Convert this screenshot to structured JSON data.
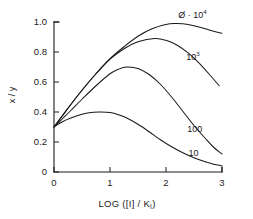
{
  "chart_data": {
    "type": "line",
    "title": "",
    "xlabel": "LOG ([I] / K",
    "xlabel_sub": "I",
    "xlabel_tail": ")",
    "ylabel": "x / y",
    "xlim": [
      0,
      3
    ],
    "ylim": [
      0,
      1.0
    ],
    "grid": false,
    "legend_position": "inline-curve-end",
    "xticks": [
      "0",
      "1",
      "2",
      "3"
    ],
    "xtick_values": [
      0,
      1,
      2,
      3
    ],
    "yticks": [
      "0",
      "0.2",
      "0.4",
      "0.6",
      "0.8",
      "1.0"
    ],
    "ytick_values": [
      0,
      0.2,
      0.4,
      0.6,
      0.8,
      1.0
    ],
    "common_origin": [
      0,
      0.3
    ],
    "series": [
      {
        "name": "phi-10-4",
        "label_base": "Ø · 10",
        "label_sup": "4",
        "label_x": 2.22,
        "label_y": 1.05,
        "peak_x": 2.15,
        "peak_y": 0.99,
        "end_y": 0.93,
        "x": [
          0,
          0.15,
          0.3,
          0.5,
          0.75,
          1.0,
          1.25,
          1.5,
          1.75,
          2.0,
          2.15,
          2.3,
          2.5,
          2.7,
          2.85,
          3.0
        ],
        "y": [
          0.3,
          0.375,
          0.45,
          0.545,
          0.655,
          0.755,
          0.835,
          0.905,
          0.955,
          0.983,
          0.99,
          0.988,
          0.975,
          0.955,
          0.938,
          0.925
        ]
      },
      {
        "name": "10-3",
        "label_base": "10",
        "label_sup": "3",
        "label_x": 2.36,
        "label_y": 0.77,
        "peak_x": 1.8,
        "peak_y": 0.89,
        "end_y": 0.56,
        "x": [
          0,
          0.15,
          0.3,
          0.5,
          0.75,
          1.0,
          1.25,
          1.5,
          1.8,
          2.0,
          2.2,
          2.4,
          2.6,
          2.8,
          2.95
        ],
        "y": [
          0.3,
          0.375,
          0.45,
          0.545,
          0.655,
          0.752,
          0.822,
          0.868,
          0.89,
          0.878,
          0.845,
          0.792,
          0.723,
          0.64,
          0.575
        ]
      },
      {
        "name": "100",
        "label_base": "100",
        "label_sup": "",
        "label_x": 2.38,
        "label_y": 0.285,
        "peak_x": 1.3,
        "peak_y": 0.7,
        "end_y": 0.1,
        "x": [
          0,
          0.15,
          0.3,
          0.5,
          0.75,
          1.0,
          1.15,
          1.3,
          1.5,
          1.7,
          1.9,
          2.1,
          2.3,
          2.5,
          2.7,
          2.85,
          3.0
        ],
        "y": [
          0.3,
          0.355,
          0.41,
          0.485,
          0.575,
          0.655,
          0.685,
          0.7,
          0.69,
          0.65,
          0.585,
          0.5,
          0.405,
          0.31,
          0.225,
          0.165,
          0.12
        ]
      },
      {
        "name": "10",
        "label_base": "10",
        "label_sup": "",
        "label_x": 2.4,
        "label_y": 0.125,
        "peak_x": 0.85,
        "peak_y": 0.4,
        "end_y": 0.04,
        "x": [
          0,
          0.15,
          0.3,
          0.5,
          0.7,
          0.85,
          1.0,
          1.15,
          1.3,
          1.5,
          1.7,
          1.9,
          2.1,
          2.3,
          2.5,
          2.7,
          2.85,
          3.0
        ],
        "y": [
          0.3,
          0.335,
          0.36,
          0.385,
          0.398,
          0.4,
          0.396,
          0.382,
          0.36,
          0.318,
          0.268,
          0.215,
          0.168,
          0.128,
          0.095,
          0.068,
          0.052,
          0.042
        ]
      }
    ]
  }
}
